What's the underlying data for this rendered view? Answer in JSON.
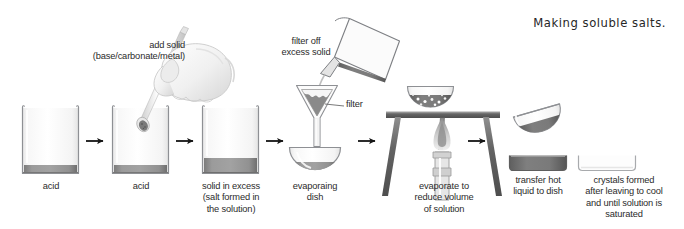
{
  "title": "Making soluble salts.",
  "diagram": {
    "type": "process-flow",
    "steps": [
      {
        "id": "step-1",
        "apparatus": "beaker",
        "label": "acid",
        "contents": "acid",
        "liquid_level": "low"
      },
      {
        "id": "step-2",
        "apparatus": "beaker",
        "label": "acid",
        "annotation": "add solid\n(base/carbonate/metal)",
        "contents": "acid + solid being added by spatula",
        "liquid_level": "low"
      },
      {
        "id": "step-3",
        "apparatus": "beaker",
        "label": "solid in excess\n(salt formed in\nthe solution)",
        "contents": "salt solution with excess solid",
        "liquid_level": "medium"
      },
      {
        "id": "step-4",
        "apparatus": "filter-funnel-and-dish",
        "annotation": "filter off\nexcess solid",
        "part_label": "filter",
        "label": "evaporaing\ndish",
        "contents": "filtrate collected in evaporating dish"
      },
      {
        "id": "step-5",
        "apparatus": "tripod-gauze-bunsen",
        "label": "evaporate to\nreduce volume\nof solution",
        "contents": "solution being heated, crystals appearing"
      },
      {
        "id": "step-6",
        "apparatus": "evaporating-dish-pouring",
        "label": "transfer hot\nliquid to dish",
        "contents": "hot saturated solution"
      },
      {
        "id": "step-7",
        "apparatus": "crystallising-dish",
        "label": "crystals formed\nafter leaving to cool\nand until solution is\nsaturated",
        "contents": "crystals"
      }
    ],
    "arrows": [
      {
        "id": "arrow-1",
        "from": "step-1",
        "to": "step-2"
      },
      {
        "id": "arrow-2",
        "from": "step-2",
        "to": "step-3"
      },
      {
        "id": "arrow-3",
        "from": "step-3",
        "to": "step-4"
      },
      {
        "id": "arrow-4",
        "from": "step-4",
        "to": "step-5"
      },
      {
        "id": "arrow-5",
        "from": "step-5",
        "to": "step-6"
      }
    ],
    "labels": {
      "acid_1": "acid",
      "acid_2": "acid",
      "add_solid": "add solid\n(base/carbonate/metal)",
      "solid_in_excess": "solid in excess\n(salt formed in\nthe solution)",
      "filter_off": "filter off\nexcess solid",
      "filter": "filter",
      "evaporating_dish": "evaporaing\ndish",
      "evaporate_to_reduce": "evaporate to\nreduce volume\nof solution",
      "transfer_hot": "transfer hot\nliquid to dish",
      "crystals_formed": "crystals formed\nafter leaving to cool\nand until solution is\nsaturated"
    },
    "colors": {
      "background": "#ffffff",
      "glass_outline": "#8e9094",
      "glass_fill_light": "#fdfdfd",
      "glass_fill_shade": "#ededed",
      "liquid": "#8e8e8e",
      "liquid_dark": "#6f6f6f",
      "metal": "#6b6b6b",
      "text": "#2b2b2b",
      "arrow": "#1a1a1a",
      "skin": "#f2f2f2",
      "skin_shade": "#d9d9d9"
    }
  }
}
